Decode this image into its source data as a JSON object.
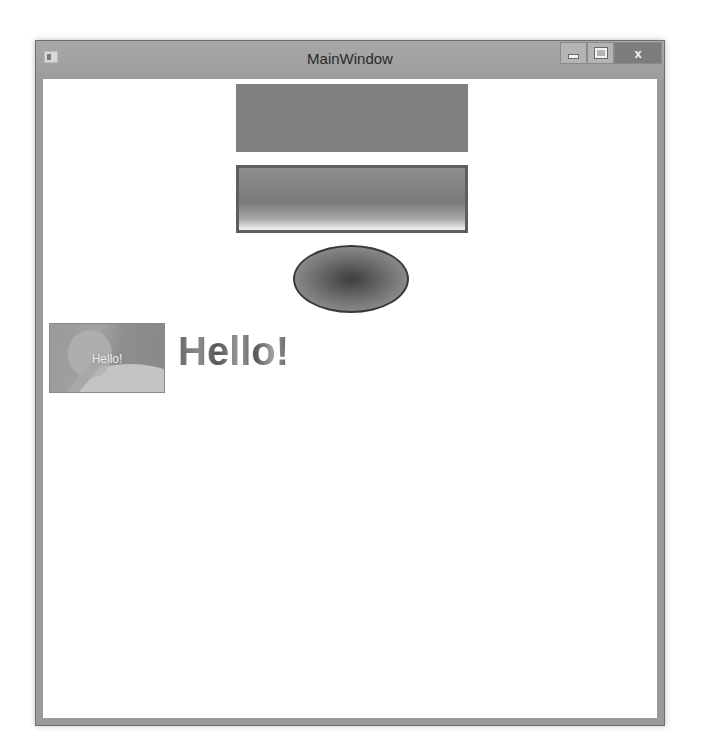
{
  "window": {
    "title": "MainWindow",
    "controls": {
      "minimize": "minimize",
      "maximize": "maximize",
      "close": "x"
    }
  },
  "content": {
    "image_overlay_text": "Hello!",
    "heading_text": "Hello!"
  },
  "colors": {
    "solid_rect": "#808080",
    "gradient_rect_border": "#5e5e5e",
    "ellipse_border": "#3a3a3a"
  }
}
